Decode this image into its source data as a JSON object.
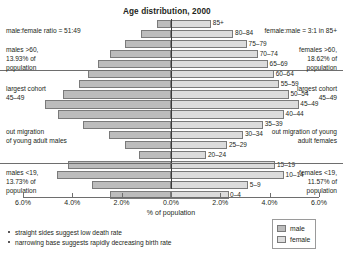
{
  "chart_data": {
    "type": "bar",
    "subtype": "population-pyramid",
    "title": "Age distribution, 2000",
    "xlabel": "% of population",
    "ylabel": "",
    "categories": [
      "85+",
      "80–84",
      "75–79",
      "70–74",
      "65–69",
      "60–64",
      "55–59",
      "50–54",
      "45–49",
      "40–44",
      "35–39",
      "30–34",
      "25–29",
      "20–24",
      "15–19",
      "10–14",
      "5–9",
      "0–4"
    ],
    "series": [
      {
        "name": "male",
        "values": [
          0.55,
          1.2,
          1.85,
          2.45,
          2.95,
          3.35,
          3.7,
          4.35,
          5.1,
          4.55,
          3.55,
          2.5,
          1.85,
          1.3,
          4.15,
          4.6,
          3.2,
          2.45
        ]
      },
      {
        "name": "female",
        "values": [
          1.65,
          2.55,
          3.1,
          3.55,
          3.95,
          4.2,
          4.4,
          4.8,
          5.2,
          4.6,
          3.75,
          2.95,
          2.3,
          1.45,
          4.25,
          4.6,
          3.15,
          2.35
        ]
      }
    ],
    "xlim": [
      6.0,
      6.0
    ],
    "xticks": [
      "6.0%",
      "4.0%",
      "2.0%",
      "0.0%",
      "2.0%",
      "4.0%",
      "6.0%"
    ],
    "grid": false,
    "legend_position": "bottom-right",
    "legend": [
      "male",
      "female"
    ]
  },
  "chart": {
    "title": "Age distribution, 2000",
    "axis_caption": "% of population",
    "ticks": [
      {
        "label": "6.0%",
        "x": 23
      },
      {
        "label": "4.0%",
        "x": 72.3
      },
      {
        "label": "2.0%",
        "x": 121.6
      },
      {
        "label": "0.0%",
        "x": 171
      },
      {
        "label": "2.0%",
        "x": 220.3
      },
      {
        "label": "4.0%",
        "x": 269.6
      },
      {
        "label": "6.0%",
        "x": 319
      }
    ]
  },
  "annotations": {
    "left": [
      {
        "name": "male-female-ratio",
        "text": "male:female ratio = 51:49",
        "top": 26
      },
      {
        "name": "males-over-60",
        "text": "males >60,\n13.93% of\npopulation",
        "top": 45
      },
      {
        "name": "largest-cohort-left",
        "text": "largest cohort\n45–49",
        "top": 84
      },
      {
        "name": "out-migration-males",
        "text": "out migration\nof young adult males",
        "top": 127
      },
      {
        "name": "males-under-19",
        "text": "males <19,\n13.73% of\npopulation",
        "top": 168
      }
    ],
    "right": [
      {
        "name": "female-male-ratio-85plus",
        "text": "female:male = 3:1 in 85+",
        "top": 26
      },
      {
        "name": "females-over-60",
        "text": "females >60,\n18.62% of\npopulation",
        "top": 45
      },
      {
        "name": "largest-cohort-right",
        "text": "largest cohort\n45–49",
        "top": 84
      },
      {
        "name": "out-migration-females",
        "text": "out migration of young\nadult females",
        "top": 127
      },
      {
        "name": "females-under-19",
        "text": "females <19,\n11.57% of\npopulation",
        "top": 168
      }
    ]
  },
  "bullets": [
    "straight sides suggest low death rate",
    "narrowing base suggests rapidly decreasing birth rate"
  ],
  "legend": {
    "items": [
      {
        "label": "male",
        "color": "#bcbcbc"
      },
      {
        "label": "female",
        "color": "#dcdcdc"
      }
    ]
  },
  "colors": {
    "male": "#bcbcbc",
    "female": "#dcdcdc",
    "stroke": "#7a7a7a",
    "axis": "#6e6e6e",
    "text": "#231f20"
  }
}
